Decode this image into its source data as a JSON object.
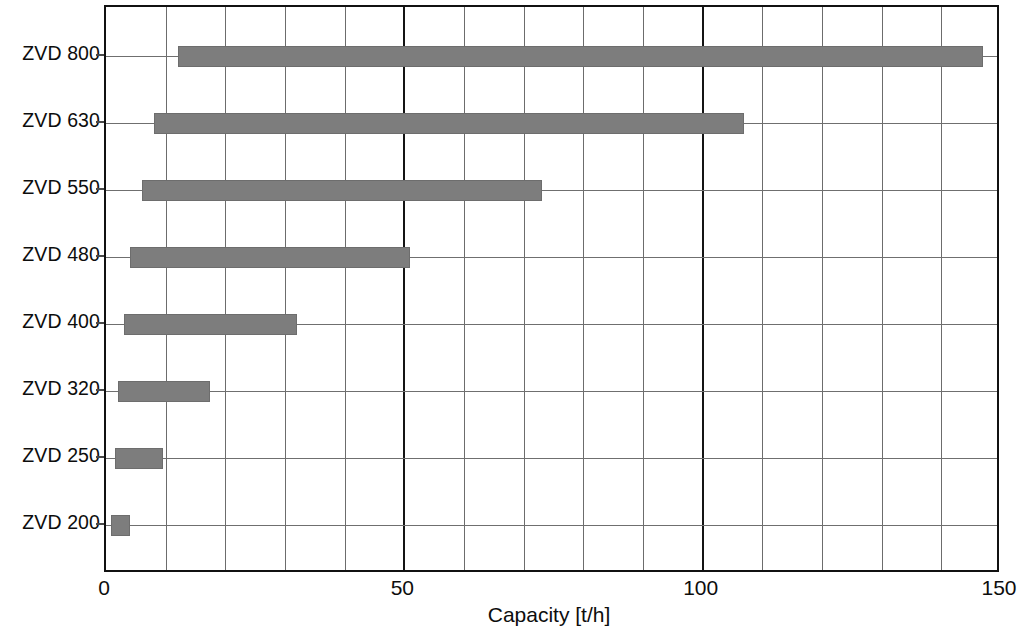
{
  "chart_data": {
    "type": "bar",
    "orientation": "horizontal",
    "subtype": "range-bar",
    "title": "",
    "xlabel": "Capacity [t/h]",
    "ylabel": "",
    "xlim": [
      0,
      150
    ],
    "ylim": null,
    "grid": true,
    "grid_minor_step": 10,
    "legend": false,
    "legend_position": "none",
    "bar_color": "#7d7d7d",
    "axis_color": "#111111",
    "categories": [
      "ZVD 800",
      "ZVD 630",
      "ZVD 550",
      "ZVD 480",
      "ZVD 400",
      "ZVD 320",
      "ZVD 250",
      "ZVD 200"
    ],
    "xticks": [
      0,
      50,
      100,
      150
    ],
    "xticklabels": [
      "0",
      "50",
      "100",
      "150"
    ],
    "series": [
      {
        "name": "Capacity range",
        "ranges": [
          {
            "category": "ZVD 800",
            "start": 12,
            "end": 147
          },
          {
            "category": "ZVD 630",
            "start": 8,
            "end": 107
          },
          {
            "category": "ZVD 550",
            "start": 6,
            "end": 73
          },
          {
            "category": "ZVD 480",
            "start": 4,
            "end": 51
          },
          {
            "category": "ZVD 400",
            "start": 3,
            "end": 32
          },
          {
            "category": "ZVD 320",
            "start": 2,
            "end": 17.5
          },
          {
            "category": "ZVD 250",
            "start": 1.5,
            "end": 9.5
          },
          {
            "category": "ZVD 200",
            "start": 0.8,
            "end": 4
          }
        ]
      }
    ]
  },
  "axis": {
    "x_title": "Capacity [t/h]"
  }
}
